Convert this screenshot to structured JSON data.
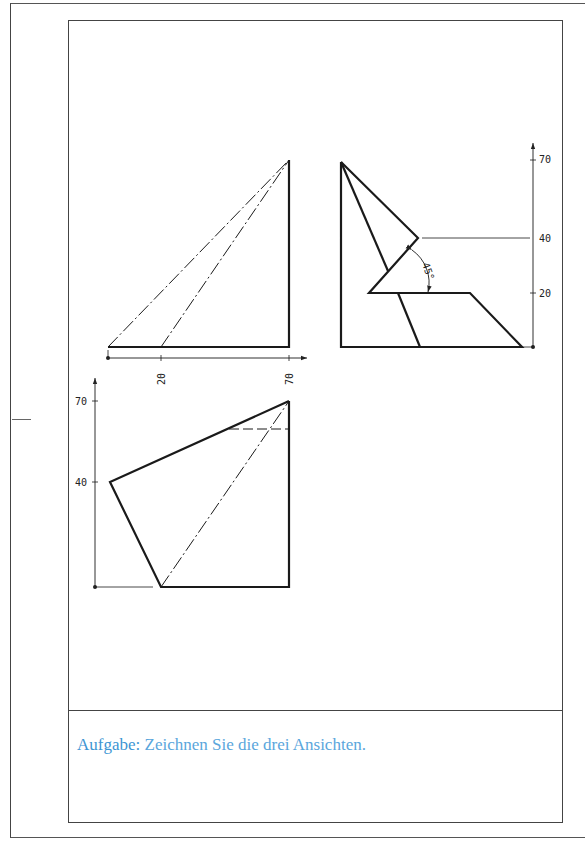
{
  "task": {
    "label": "Aufgabe:",
    "text": " Zeichnen Sie die drei Ansichten."
  },
  "views": {
    "front": {
      "dimensions_x": [
        "20",
        "70"
      ]
    },
    "side": {
      "dimensions_y": [
        "70",
        "40",
        "20"
      ],
      "angle": "45°"
    },
    "top": {
      "dimensions_y": [
        "70",
        "40"
      ]
    }
  },
  "colors": {
    "task_text": "#5aa6dc",
    "line": "#1a1a1a"
  }
}
